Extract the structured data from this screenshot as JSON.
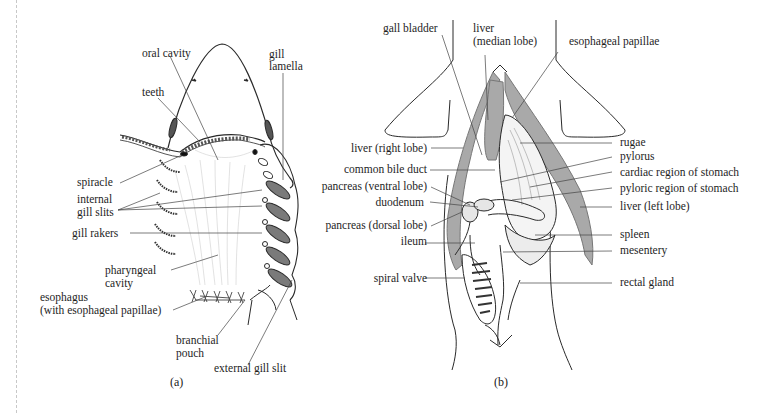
{
  "figure_a": {
    "caption": "(a)",
    "labels": {
      "oral_cavity": "oral cavity",
      "teeth": "teeth",
      "gill_lamella_1": "gill",
      "gill_lamella_2": "lamella",
      "spiracle": "spiracle",
      "internal_gill_slits_1": "internal",
      "internal_gill_slits_2": "gill slits",
      "gill_rakers": "gill rakers",
      "pharyngeal_cavity_1": "pharyngeal",
      "pharyngeal_cavity_2": "cavity",
      "esophagus_1": "esophagus",
      "esophagus_2": "(with esophageal papillae)",
      "branchial_pouch_1": "branchial",
      "branchial_pouch_2": "pouch",
      "external_gill_slit": "external gill slit"
    }
  },
  "figure_b": {
    "caption": "(b)",
    "labels": {
      "gall_bladder": "gall bladder",
      "liver_median_1": "liver",
      "liver_median_2": "(median lobe)",
      "esophageal_papillae": "esophageal papillae",
      "liver_right": "liver (right lobe)",
      "common_bile_duct": "common bile duct",
      "pancreas_ventral": "pancreas (ventral lobe)",
      "duodenum": "duodenum",
      "pancreas_dorsal": "pancreas (dorsal lobe)",
      "ileum": "ileum",
      "spiral_valve": "spiral valve",
      "rugae": "rugae",
      "pylorus": "pylorus",
      "cardiac_region": "cardiac region of stomach",
      "pyloric_region": "pyloric region of stomach",
      "liver_left": "liver (left lobe)",
      "spleen": "spleen",
      "mesentery": "mesentery",
      "rectal_gland": "rectal gland"
    }
  },
  "colors": {
    "liver_fill": "#a9a9a9",
    "line": "#2a2a2a",
    "leader": "#444444"
  }
}
